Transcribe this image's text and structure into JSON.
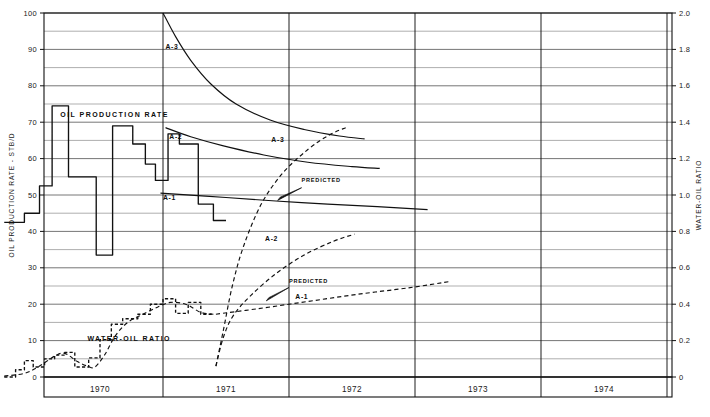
{
  "chart_data": {
    "type": "line",
    "title": "",
    "xlabel": "",
    "ylabel": "OIL PRODUCTION RATE - STB/D",
    "y2label": "WATER-OIL RATIO",
    "xlim": [
      1969.7,
      1974.7
    ],
    "ylim": [
      0,
      100
    ],
    "y2lim": [
      0,
      2.0
    ],
    "grid": true,
    "legend_position": "inline-labels",
    "x_categories": [
      "1970",
      "1971",
      "1972",
      "1973",
      "1974"
    ],
    "y_ticks": [
      0,
      10,
      20,
      30,
      40,
      50,
      60,
      70,
      80,
      90,
      100
    ],
    "y_minor_ticks": [
      5,
      15,
      25,
      35,
      45,
      55,
      65,
      75,
      85,
      95
    ],
    "y2_ticks": [
      "0",
      "0.2",
      "0.4",
      "0.6",
      "0.8",
      "1.0",
      "1.2",
      "1.4",
      "1.6",
      "1.8",
      "2.0"
    ],
    "annotations": [
      {
        "id": "oil-production-rate-title",
        "text": "OIL PRODUCTION RATE",
        "x": 0.185,
        "y": 71.5
      },
      {
        "id": "water-oil-ratio-title",
        "text": "WATER-OIL RATIO",
        "x": 0.4,
        "y": 10.0
      },
      {
        "id": "predicted-oil",
        "text": "PREDICTED",
        "x": 2.1,
        "y": 53.5
      },
      {
        "id": "predicted-wor",
        "text": "PREDICTED",
        "x": 2.0,
        "y": 25.8
      },
      {
        "id": "label-a3-oil",
        "text": "A-3",
        "x": 1.02,
        "y": 90.0
      },
      {
        "id": "label-a2-oil",
        "text": "A-2",
        "x": 1.05,
        "y": 65.5
      },
      {
        "id": "label-a1-oil",
        "text": "A-1",
        "x": 1.0,
        "y": 48.5
      },
      {
        "id": "label-a3-wor",
        "text": "A-3",
        "x": 1.86,
        "y": 64.5
      },
      {
        "id": "label-a2-wor",
        "text": "A-2",
        "x": 1.81,
        "y": 37.5
      },
      {
        "id": "label-a1-wor",
        "text": "A-1",
        "x": 2.05,
        "y": 21.5
      }
    ],
    "series": [
      {
        "name": "Oil production rate history (measured)",
        "style": "step-solid",
        "axis": "left",
        "points": [
          [
            1969.74,
            42.5
          ],
          [
            1969.9,
            42.5
          ],
          [
            1969.9,
            45.0
          ],
          [
            1970.02,
            45.0
          ],
          [
            1970.02,
            52.5
          ],
          [
            1970.12,
            52.5
          ],
          [
            1970.12,
            74.5
          ],
          [
            1970.25,
            74.5
          ],
          [
            1970.25,
            55.0
          ],
          [
            1970.47,
            55.0
          ],
          [
            1970.47,
            33.5
          ],
          [
            1970.6,
            33.5
          ],
          [
            1970.6,
            69.0
          ],
          [
            1970.76,
            69.0
          ],
          [
            1970.76,
            64.0
          ],
          [
            1970.86,
            64.0
          ],
          [
            1970.86,
            58.5
          ],
          [
            1970.94,
            58.5
          ],
          [
            1970.94,
            54.0
          ],
          [
            1971.04,
            54.0
          ],
          [
            1971.04,
            66.8
          ],
          [
            1971.13,
            66.8
          ],
          [
            1971.13,
            64.0
          ],
          [
            1971.28,
            64.0
          ],
          [
            1971.28,
            47.5
          ],
          [
            1971.4,
            47.5
          ],
          [
            1971.4,
            43.0
          ],
          [
            1971.5,
            43.0
          ]
        ]
      },
      {
        "name": "A-3 oil rate forecast",
        "style": "solid",
        "axis": "left",
        "points": [
          [
            1971.0,
            100.0
          ],
          [
            1971.1,
            93.5
          ],
          [
            1971.22,
            87.0
          ],
          [
            1971.38,
            80.5
          ],
          [
            1971.58,
            75.0
          ],
          [
            1971.85,
            70.6
          ],
          [
            1972.12,
            68.0
          ],
          [
            1972.4,
            66.2
          ],
          [
            1972.6,
            65.4
          ]
        ]
      },
      {
        "name": "A-2 oil rate forecast",
        "style": "solid",
        "axis": "left",
        "points": [
          [
            1971.02,
            68.5
          ],
          [
            1971.22,
            66.0
          ],
          [
            1971.48,
            63.5
          ],
          [
            1971.8,
            61.0
          ],
          [
            1972.15,
            59.0
          ],
          [
            1972.5,
            57.8
          ],
          [
            1972.72,
            57.3
          ]
        ]
      },
      {
        "name": "A-1 oil rate forecast",
        "style": "solid",
        "axis": "left",
        "points": [
          [
            1970.98,
            50.5
          ],
          [
            1971.5,
            49.3
          ],
          [
            1972.1,
            47.9
          ],
          [
            1972.7,
            46.8
          ],
          [
            1973.1,
            46.0
          ]
        ]
      },
      {
        "name": "Water-oil ratio history (measured)",
        "style": "step-dashed",
        "axis": "right",
        "points": [
          [
            1969.74,
            0.0
          ],
          [
            1969.83,
            0.0
          ],
          [
            1969.83,
            0.04
          ],
          [
            1969.9,
            0.04
          ],
          [
            1969.9,
            0.09
          ],
          [
            1969.97,
            0.09
          ],
          [
            1969.97,
            0.055
          ],
          [
            1970.06,
            0.055
          ],
          [
            1970.06,
            0.1
          ],
          [
            1970.14,
            0.1
          ],
          [
            1970.14,
            0.12
          ],
          [
            1970.22,
            0.12
          ],
          [
            1970.22,
            0.135
          ],
          [
            1970.3,
            0.135
          ],
          [
            1970.3,
            0.055
          ],
          [
            1970.41,
            0.055
          ],
          [
            1970.41,
            0.105
          ],
          [
            1970.5,
            0.105
          ],
          [
            1970.5,
            0.205
          ],
          [
            1970.59,
            0.205
          ],
          [
            1970.59,
            0.29
          ],
          [
            1970.68,
            0.29
          ],
          [
            1970.68,
            0.32
          ],
          [
            1970.8,
            0.32
          ],
          [
            1970.8,
            0.345
          ],
          [
            1970.9,
            0.345
          ],
          [
            1970.9,
            0.4
          ],
          [
            1971.0,
            0.4
          ],
          [
            1971.0,
            0.43
          ],
          [
            1971.1,
            0.43
          ],
          [
            1971.1,
            0.35
          ],
          [
            1971.2,
            0.35
          ],
          [
            1971.2,
            0.41
          ],
          [
            1971.3,
            0.41
          ],
          [
            1971.3,
            0.345
          ],
          [
            1971.4,
            0.345
          ]
        ]
      },
      {
        "name": "Water-oil ratio smooth trend (historic)",
        "style": "dashed",
        "axis": "right",
        "points": [
          [
            1969.74,
            0.005
          ],
          [
            1969.9,
            0.02
          ],
          [
            1970.02,
            0.06
          ],
          [
            1970.14,
            0.115
          ],
          [
            1970.22,
            0.13
          ],
          [
            1970.32,
            0.085
          ],
          [
            1970.4,
            0.06
          ],
          [
            1970.46,
            0.055
          ],
          [
            1970.54,
            0.125
          ],
          [
            1970.62,
            0.225
          ],
          [
            1970.72,
            0.3
          ],
          [
            1970.84,
            0.345
          ],
          [
            1970.96,
            0.385
          ],
          [
            1971.06,
            0.41
          ],
          [
            1971.18,
            0.4
          ],
          [
            1971.3,
            0.355
          ],
          [
            1971.4,
            0.345
          ]
        ]
      },
      {
        "name": "A-3 water-oil ratio forecast",
        "style": "dashed",
        "axis": "right",
        "points": [
          [
            1971.42,
            0.06
          ],
          [
            1971.48,
            0.26
          ],
          [
            1971.55,
            0.5
          ],
          [
            1971.64,
            0.72
          ],
          [
            1971.78,
            0.95
          ],
          [
            1971.95,
            1.12
          ],
          [
            1972.15,
            1.25
          ],
          [
            1972.32,
            1.33
          ],
          [
            1972.45,
            1.37
          ]
        ]
      },
      {
        "name": "A-2 water-oil ratio forecast",
        "style": "dashed",
        "axis": "right",
        "points": [
          [
            1971.42,
            0.06
          ],
          [
            1971.48,
            0.22
          ],
          [
            1971.56,
            0.34
          ],
          [
            1971.7,
            0.45
          ],
          [
            1971.9,
            0.57
          ],
          [
            1972.12,
            0.67
          ],
          [
            1972.35,
            0.745
          ],
          [
            1972.52,
            0.785
          ]
        ]
      },
      {
        "name": "A-1 water-oil ratio forecast",
        "style": "dashed",
        "axis": "right",
        "points": [
          [
            1971.42,
            0.345
          ],
          [
            1971.75,
            0.375
          ],
          [
            1972.15,
            0.415
          ],
          [
            1972.55,
            0.455
          ],
          [
            1972.95,
            0.49
          ],
          [
            1973.28,
            0.525
          ]
        ]
      }
    ]
  },
  "axes": {
    "left_title": "OIL PRODUCTION RATE - STB/D",
    "right_title": "WATER-OIL RATIO",
    "left_ticks": [
      "0",
      "10",
      "20",
      "30",
      "40",
      "50",
      "60",
      "70",
      "80",
      "90",
      "100"
    ],
    "right_ticks": [
      "0",
      "0.2",
      "0.4",
      "0.6",
      "0.8",
      "1.0",
      "1.2",
      "1.4",
      "1.6",
      "1.8",
      "2.0"
    ],
    "year_labels": [
      "1970",
      "1971",
      "1972",
      "1973",
      "1974"
    ]
  },
  "colors": {
    "ink": "#111111",
    "grid": "#555555",
    "background": "#ffffff"
  }
}
